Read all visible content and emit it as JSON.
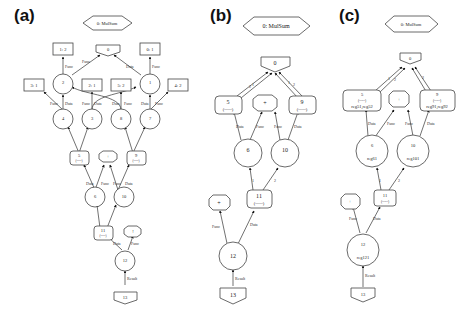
{
  "panels": [
    {
      "label": "(a)",
      "title_node": "0: MulSum",
      "nodes": {
        "n0": "0",
        "n01": "0: 1",
        "n12": "1: 2",
        "n31": "3: 1",
        "n21": "2: 1",
        "n52": "5: 2",
        "n42": "4: 2",
        "n2": "2",
        "n1": "1",
        "n4": "4",
        "n3": "3",
        "n8": "8",
        "n7": "7",
        "n5": "5",
        "n5sub": "(-----)",
        "nplus": "+",
        "n9": "9",
        "n9sub": "(-----)",
        "n6": "6",
        "n10": "10",
        "n11": "11",
        "n11sub": "(-----)",
        "nbang": "!",
        "n12b": "12",
        "n13": "13"
      },
      "edge_labels": {
        "data": "Data",
        "func": "Func",
        "result": "Result"
      }
    },
    {
      "label": "(b)",
      "title_node": "0: MulSum",
      "nodes": {
        "n0": "0",
        "n5": "5",
        "n5sub": "(-----)",
        "nplus": "+",
        "n9": "9",
        "n9sub": "(-----)",
        "n6": "6",
        "n10": "10",
        "n11": "11",
        "n11sub": "(-----)",
        "nplus2": "+",
        "n12": "12",
        "n13": "13"
      },
      "edge_labels": {
        "data": "Data",
        "func": "Func",
        "result": "Result",
        "one": "1",
        "two": "2"
      }
    },
    {
      "label": "(c)",
      "title_node": "0: MulSum",
      "nodes": {
        "n0": "0",
        "n5": "5",
        "n5sub": "(-----)",
        "n5reg": "reg51,reg52",
        "nplus": "+",
        "n9": "9",
        "n9sub": "(-----)",
        "n9reg": "reg91,reg92",
        "n6": "6",
        "n6reg": "reg61",
        "n10": "10",
        "n10reg": "reg101",
        "n11": "11",
        "n11sub": "(-----)",
        "nplus2": "+",
        "n12": "12",
        "n12reg": "reg121",
        "n13": "13"
      },
      "edge_labels": {
        "data": "Data",
        "func": "Func",
        "result": "Result",
        "one": "1",
        "two": "2"
      }
    }
  ]
}
